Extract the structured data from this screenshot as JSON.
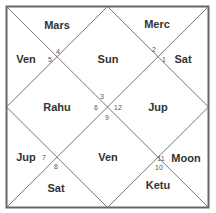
{
  "chart": {
    "style": "North Indian birth chart",
    "line_color": "#666666",
    "houses": [
      {
        "house": 1,
        "sign": "3",
        "planets": "Sun",
        "sign_pos": [
          102,
          96
        ],
        "planet_pos": [
          108,
          59
        ]
      },
      {
        "house": 2,
        "sign": "2",
        "planets": "Merc",
        "sign_pos": [
          154,
          49
        ],
        "planet_pos": [
          157,
          24
        ]
      },
      {
        "house": 3,
        "sign": "1",
        "planets": "Sat",
        "sign_pos": [
          164,
          59
        ],
        "planet_pos": [
          183,
          59
        ]
      },
      {
        "house": 4,
        "sign": "12",
        "planets": "Jup",
        "sign_pos": [
          118,
          107
        ],
        "planet_pos": [
          158,
          107
        ]
      },
      {
        "house": 5,
        "sign": "11",
        "planets": "Moon",
        "sign_pos": [
          161,
          158
        ],
        "planet_pos": [
          186,
          158
        ]
      },
      {
        "house": 6,
        "sign": "10",
        "planets": "Ketu",
        "sign_pos": [
          159,
          167
        ],
        "planet_pos": [
          158,
          185
        ]
      },
      {
        "house": 7,
        "sign": "9",
        "planets": "Ven",
        "sign_pos": [
          107,
          117
        ],
        "planet_pos": [
          108,
          157
        ]
      },
      {
        "house": 8,
        "sign": "8",
        "planets": "Sat",
        "sign_pos": [
          56,
          166
        ],
        "planet_pos": [
          56,
          188
        ]
      },
      {
        "house": 9,
        "sign": "7",
        "planets": "Jup",
        "sign_pos": [
          44,
          157
        ],
        "planet_pos": [
          26,
          157
        ]
      },
      {
        "house": 10,
        "sign": "6",
        "planets": "Rahu",
        "sign_pos": [
          96,
          107
        ],
        "planet_pos": [
          57,
          107
        ]
      },
      {
        "house": 11,
        "sign": "5",
        "planets": "Ven",
        "sign_pos": [
          50,
          59
        ],
        "planet_pos": [
          26,
          59
        ]
      },
      {
        "house": 12,
        "sign": "4",
        "planets": "Mars",
        "sign_pos": [
          58,
          51
        ],
        "planet_pos": [
          57,
          25
        ]
      }
    ]
  }
}
